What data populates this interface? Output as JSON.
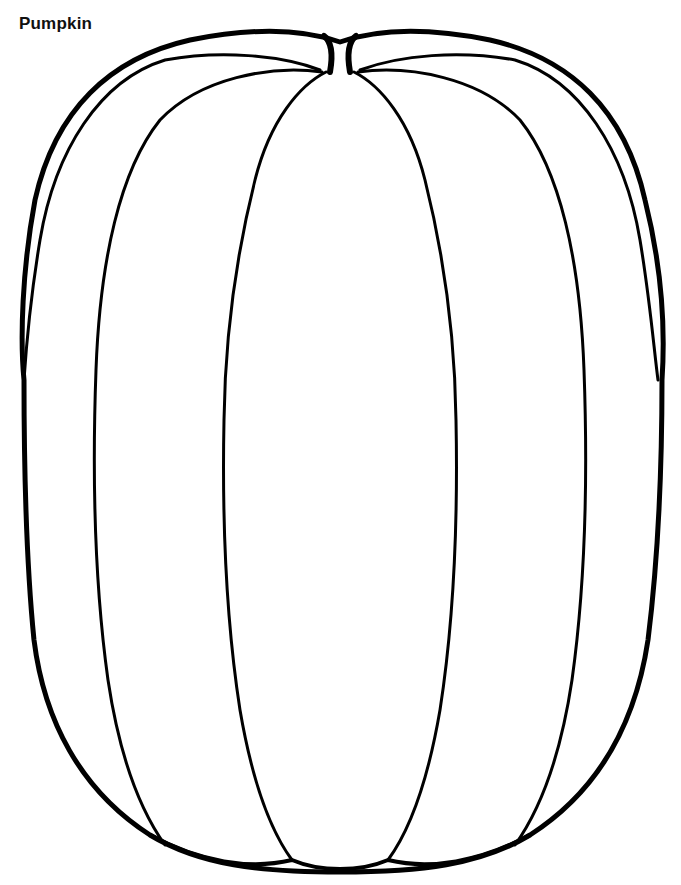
{
  "page": {
    "title": "Pumpkin"
  },
  "illustration": {
    "subject": "pumpkin-outline",
    "style": "coloring-page line art",
    "stroke_color": "#000000",
    "background_color": "#ffffff",
    "segments": 7
  }
}
